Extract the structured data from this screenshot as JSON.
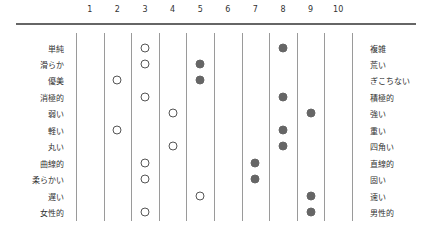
{
  "chart_data": {
    "type": "scatter",
    "title": "",
    "subtitle": "Semantic differential profile",
    "x_ticks": [
      "1",
      "2",
      "3",
      "4",
      "5",
      "6",
      "7",
      "8",
      "9",
      "10"
    ],
    "xlim": [
      1,
      10
    ],
    "grid": true,
    "legend": null,
    "rows": [
      {
        "left": "単純",
        "right": "複雑",
        "open": 3,
        "filled": 8
      },
      {
        "left": "滑らか",
        "right": "荒い",
        "open": 3,
        "filled": 5
      },
      {
        "left": "優美",
        "right": "ぎこちない",
        "open": 2,
        "filled": 5
      },
      {
        "left": "消極的",
        "right": "積極的",
        "open": 3,
        "filled": 8
      },
      {
        "left": "弱い",
        "right": "強い",
        "open": 4,
        "filled": 9
      },
      {
        "left": "軽い",
        "right": "重い",
        "open": 2,
        "filled": 8
      },
      {
        "left": "丸い",
        "right": "四角い",
        "open": 4,
        "filled": 8
      },
      {
        "left": "曲線的",
        "right": "直線的",
        "open": 3,
        "filled": 7
      },
      {
        "left": "柔らかい",
        "right": "固い",
        "open": 3,
        "filled": 7
      },
      {
        "left": "遅い",
        "right": "速い",
        "open": 5,
        "filled": 9
      },
      {
        "left": "女性的",
        "right": "男性的",
        "open": 3,
        "filled": 9
      }
    ],
    "series": [
      {
        "name": "open-circle",
        "marker": "open",
        "values": [
          3,
          3,
          2,
          3,
          4,
          2,
          4,
          3,
          3,
          5,
          3
        ]
      },
      {
        "name": "filled-circle",
        "marker": "filled",
        "values": [
          8,
          5,
          5,
          8,
          9,
          8,
          8,
          7,
          7,
          9,
          9
        ]
      }
    ],
    "colors": {
      "filled": "#666666",
      "open_border": "#555555",
      "gridline": "#9a9a9a",
      "axis": "#666666"
    }
  }
}
